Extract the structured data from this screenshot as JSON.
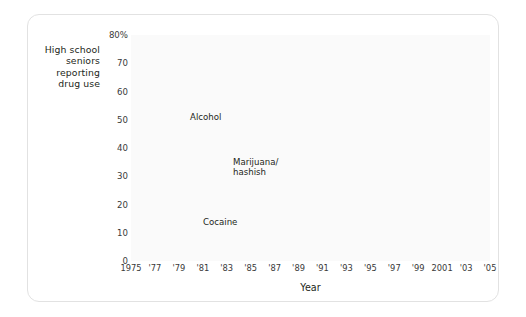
{
  "figure": {
    "y_axis_caption_lines": [
      "High school",
      "seniors",
      "reporting",
      "drug use"
    ],
    "x_axis_title": "Year"
  },
  "annotations": {
    "alcohol": "Alcohol",
    "marijuana_line1": "Marijuana/",
    "marijuana_line2": "hashish",
    "cocaine": "Cocaine"
  },
  "colors": {
    "series_line": "#d2d2d2",
    "grid": "#e6e6e6",
    "axis": "#b0b0b0",
    "plot_background": "#fafafa",
    "card_border": "#e2e2e2",
    "text": "#231f20"
  },
  "chart_data": {
    "type": "line",
    "title": "",
    "subtitle": "",
    "xlabel": "Year",
    "ylabel": "High school seniors reporting drug use",
    "xlim": [
      1975,
      2005
    ],
    "ylim": [
      0,
      80
    ],
    "grid": true,
    "legend": "inline-annotations",
    "ytick_values": [
      0,
      10,
      20,
      30,
      40,
      50,
      60,
      70,
      80
    ],
    "ytick_labels": [
      "0",
      "10",
      "20",
      "30",
      "40",
      "50",
      "60",
      "70",
      "80%"
    ],
    "xtick_values": [
      1975,
      1977,
      1979,
      1981,
      1983,
      1985,
      1987,
      1989,
      1991,
      1993,
      1995,
      1997,
      1999,
      2001,
      2003,
      2005
    ],
    "xtick_labels": [
      "1975",
      "'77",
      "'79",
      "'81",
      "'83",
      "'85",
      "'87",
      "'89",
      "'91",
      "'93",
      "'95",
      "'97",
      "'99",
      "2001",
      "'03",
      "'05"
    ],
    "x": [
      1975,
      1976,
      1977,
      1978,
      1979,
      1980,
      1981,
      1982,
      1983,
      1984,
      1985,
      1986,
      1987,
      1988,
      1989,
      1990,
      1991,
      1992,
      1993,
      1994,
      1995,
      1996,
      1997,
      1998,
      1999,
      2000,
      2001,
      2002,
      2003,
      2004,
      2005
    ],
    "series": [
      {
        "name": "Alcohol",
        "values": [
          68,
          68,
          70,
          71,
          71,
          71,
          71,
          70,
          69,
          67,
          66,
          65,
          66,
          64,
          60,
          57,
          54,
          51,
          51,
          51,
          51,
          51,
          53,
          52,
          51,
          50,
          50,
          49,
          48,
          48,
          47
        ]
      },
      {
        "name": "Marijuana/hashish",
        "values": [
          27,
          32,
          35,
          37,
          37,
          34,
          32,
          29,
          27,
          25,
          26,
          24,
          21,
          18,
          17,
          15,
          14,
          12,
          16,
          19,
          21,
          22,
          24,
          23,
          23,
          22,
          22,
          22,
          22,
          20,
          20
        ]
      },
      {
        "name": "Cocaine",
        "values": [
          2,
          2,
          3,
          4,
          6,
          5,
          6,
          5,
          5,
          5,
          7,
          6,
          4,
          3,
          3,
          2,
          2,
          1,
          2,
          2,
          2,
          2,
          2,
          2,
          3,
          2,
          2,
          2,
          2,
          2,
          3
        ]
      }
    ]
  }
}
